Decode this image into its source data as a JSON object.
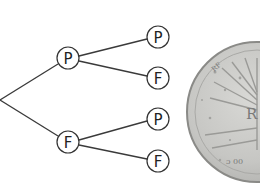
{
  "diagram": {
    "type": "probability-tree",
    "root": {
      "x": 0,
      "y": 100
    },
    "level1": [
      {
        "id": "n1",
        "label": "P",
        "x": 68,
        "y": 58
      },
      {
        "id": "n2",
        "label": "F",
        "x": 68,
        "y": 142
      }
    ],
    "level2": [
      {
        "id": "n11",
        "parent": "n1",
        "label": "P",
        "x": 158,
        "y": 37
      },
      {
        "id": "n12",
        "parent": "n1",
        "label": "F",
        "x": 158,
        "y": 78
      },
      {
        "id": "n21",
        "parent": "n2",
        "label": "P",
        "x": 158,
        "y": 119
      },
      {
        "id": "n22",
        "parent": "n2",
        "label": "F",
        "x": 158,
        "y": 161
      }
    ],
    "node_radius": 11
  },
  "coin": {
    "description": "French euro coin (tree of life design), partially cropped",
    "center": {
      "x": 257,
      "y": 112
    },
    "radius": 70,
    "initial": "R",
    "colors": {
      "face": "#c9c9c6",
      "rim": "#8f8f8c",
      "detail": "#9a9a97"
    }
  }
}
